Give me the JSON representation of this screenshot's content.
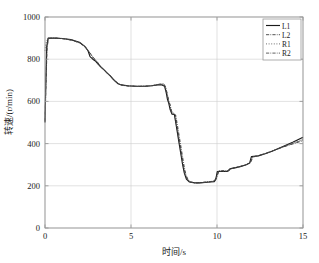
{
  "chart_data": {
    "type": "line",
    "title": "",
    "xlabel": "时间/s",
    "ylabel": "转速/(r/min)",
    "xlim": [
      0,
      15
    ],
    "ylim": [
      0,
      1000
    ],
    "xticks": [
      0,
      5,
      10,
      15
    ],
    "yticks": [
      0,
      200,
      400,
      600,
      800,
      1000
    ],
    "xtick_labels": [
      "0",
      "5",
      "10",
      "15"
    ],
    "ytick_labels": [
      "0",
      "200",
      "400",
      "600",
      "800",
      "1000"
    ],
    "grid": true,
    "legend_position": "top-right",
    "legend": [
      "L1",
      "L2",
      "R1",
      "R2"
    ],
    "series": [
      {
        "name": "L1",
        "style": "solid",
        "color": "#1a1a1a",
        "points": [
          [
            0.0,
            500
          ],
          [
            0.05,
            700
          ],
          [
            0.1,
            860
          ],
          [
            0.18,
            900
          ],
          [
            0.55,
            900
          ],
          [
            1.0,
            898
          ],
          [
            1.5,
            893
          ],
          [
            2.0,
            880
          ],
          [
            2.3,
            862
          ],
          [
            2.5,
            840
          ],
          [
            2.62,
            812
          ],
          [
            2.78,
            800
          ],
          [
            2.95,
            790
          ],
          [
            3.1,
            775
          ],
          [
            3.28,
            760
          ],
          [
            3.45,
            748
          ],
          [
            3.6,
            735
          ],
          [
            3.78,
            722
          ],
          [
            3.95,
            706
          ],
          [
            4.1,
            694
          ],
          [
            4.25,
            684
          ],
          [
            4.45,
            678
          ],
          [
            4.8,
            674
          ],
          [
            5.3,
            672
          ],
          [
            5.8,
            672
          ],
          [
            6.2,
            674
          ],
          [
            6.55,
            678
          ],
          [
            6.8,
            678
          ],
          [
            6.95,
            672
          ],
          [
            7.05,
            640
          ],
          [
            7.12,
            610
          ],
          [
            7.2,
            590
          ],
          [
            7.28,
            560
          ],
          [
            7.38,
            540
          ],
          [
            7.52,
            538
          ],
          [
            7.6,
            500
          ],
          [
            7.68,
            460
          ],
          [
            7.76,
            420
          ],
          [
            7.84,
            380
          ],
          [
            7.92,
            340
          ],
          [
            8.0,
            300
          ],
          [
            8.1,
            260
          ],
          [
            8.22,
            232
          ],
          [
            8.4,
            218
          ],
          [
            8.7,
            214
          ],
          [
            9.0,
            214
          ],
          [
            9.3,
            216
          ],
          [
            9.6,
            218
          ],
          [
            9.85,
            220
          ],
          [
            9.95,
            240
          ],
          [
            10.02,
            268
          ],
          [
            10.6,
            268
          ],
          [
            10.75,
            280
          ],
          [
            11.1,
            286
          ],
          [
            11.4,
            292
          ],
          [
            11.7,
            300
          ],
          [
            11.9,
            308
          ],
          [
            12.0,
            338
          ],
          [
            12.4,
            342
          ],
          [
            12.8,
            352
          ],
          [
            13.2,
            364
          ],
          [
            13.6,
            378
          ],
          [
            14.0,
            392
          ],
          [
            14.4,
            406
          ],
          [
            14.7,
            418
          ],
          [
            15.0,
            430
          ]
        ]
      },
      {
        "name": "L2",
        "style": "dashdot",
        "color": "#333333",
        "points": [
          [
            0.0,
            505
          ],
          [
            0.06,
            690
          ],
          [
            0.12,
            850
          ],
          [
            0.2,
            898
          ],
          [
            0.6,
            900
          ],
          [
            1.1,
            897
          ],
          [
            1.6,
            890
          ],
          [
            2.05,
            876
          ],
          [
            2.35,
            858
          ],
          [
            2.55,
            836
          ],
          [
            2.68,
            820
          ],
          [
            2.82,
            806
          ],
          [
            3.0,
            792
          ],
          [
            3.18,
            772
          ],
          [
            3.34,
            756
          ],
          [
            3.5,
            744
          ],
          [
            3.66,
            730
          ],
          [
            3.84,
            718
          ],
          [
            4.0,
            702
          ],
          [
            4.16,
            690
          ],
          [
            4.32,
            682
          ],
          [
            4.52,
            676
          ],
          [
            4.9,
            673
          ],
          [
            5.4,
            671
          ],
          [
            5.9,
            672
          ],
          [
            6.3,
            675
          ],
          [
            6.6,
            680
          ],
          [
            6.88,
            682
          ],
          [
            7.0,
            668
          ],
          [
            7.1,
            636
          ],
          [
            7.18,
            604
          ],
          [
            7.26,
            586
          ],
          [
            7.34,
            556
          ],
          [
            7.44,
            544
          ],
          [
            7.58,
            536
          ],
          [
            7.66,
            492
          ],
          [
            7.74,
            452
          ],
          [
            7.82,
            412
          ],
          [
            7.9,
            372
          ],
          [
            7.98,
            332
          ],
          [
            8.06,
            292
          ],
          [
            8.16,
            254
          ],
          [
            8.28,
            230
          ],
          [
            8.46,
            218
          ],
          [
            8.76,
            214
          ],
          [
            9.06,
            215
          ],
          [
            9.36,
            217
          ],
          [
            9.66,
            220
          ],
          [
            9.9,
            224
          ],
          [
            10.0,
            246
          ],
          [
            10.08,
            270
          ],
          [
            10.66,
            270
          ],
          [
            10.82,
            282
          ],
          [
            11.16,
            288
          ],
          [
            11.46,
            294
          ],
          [
            11.76,
            302
          ],
          [
            11.95,
            312
          ],
          [
            12.05,
            336
          ],
          [
            12.45,
            344
          ],
          [
            12.85,
            354
          ],
          [
            13.25,
            366
          ],
          [
            13.65,
            378
          ],
          [
            14.05,
            390
          ],
          [
            14.45,
            402
          ],
          [
            14.75,
            410
          ],
          [
            15.0,
            418
          ]
        ]
      },
      {
        "name": "R1",
        "style": "dotted",
        "color": "#555555",
        "points": [
          [
            0.0,
            840
          ],
          [
            0.04,
            870
          ],
          [
            0.1,
            888
          ],
          [
            0.2,
            900
          ],
          [
            0.58,
            900
          ],
          [
            1.05,
            898
          ],
          [
            1.55,
            892
          ],
          [
            2.02,
            878
          ],
          [
            2.32,
            860
          ],
          [
            2.52,
            842
          ],
          [
            2.66,
            826
          ],
          [
            2.8,
            804
          ],
          [
            2.98,
            788
          ],
          [
            3.14,
            770
          ],
          [
            3.3,
            758
          ],
          [
            3.48,
            746
          ],
          [
            3.62,
            732
          ],
          [
            3.8,
            720
          ],
          [
            3.98,
            704
          ],
          [
            4.14,
            692
          ],
          [
            4.3,
            682
          ],
          [
            4.5,
            677
          ],
          [
            4.86,
            674
          ],
          [
            5.36,
            672
          ],
          [
            5.86,
            673
          ],
          [
            6.26,
            676
          ],
          [
            6.58,
            680
          ],
          [
            6.84,
            680
          ],
          [
            6.98,
            670
          ],
          [
            7.08,
            638
          ],
          [
            7.15,
            608
          ],
          [
            7.23,
            588
          ],
          [
            7.31,
            558
          ],
          [
            7.41,
            542
          ],
          [
            7.55,
            538
          ],
          [
            7.63,
            496
          ],
          [
            7.71,
            456
          ],
          [
            7.79,
            416
          ],
          [
            7.87,
            376
          ],
          [
            7.95,
            336
          ],
          [
            8.03,
            296
          ],
          [
            8.13,
            258
          ],
          [
            8.25,
            231
          ],
          [
            8.43,
            218
          ],
          [
            8.73,
            214
          ],
          [
            9.03,
            214
          ],
          [
            9.33,
            216
          ],
          [
            9.63,
            219
          ],
          [
            9.88,
            222
          ],
          [
            9.98,
            244
          ],
          [
            10.05,
            269
          ],
          [
            10.63,
            269
          ],
          [
            10.78,
            281
          ],
          [
            11.13,
            287
          ],
          [
            11.43,
            293
          ],
          [
            11.73,
            301
          ],
          [
            11.92,
            310
          ],
          [
            12.02,
            337
          ],
          [
            12.42,
            343
          ],
          [
            12.82,
            353
          ],
          [
            13.22,
            365
          ],
          [
            13.62,
            378
          ],
          [
            14.02,
            391
          ],
          [
            14.42,
            404
          ],
          [
            14.72,
            414
          ],
          [
            15.0,
            424
          ]
        ]
      },
      {
        "name": "R2",
        "style": "dashdot",
        "color": "#444444",
        "points": [
          [
            0.0,
            510
          ],
          [
            0.05,
            700
          ],
          [
            0.11,
            855
          ],
          [
            0.19,
            899
          ],
          [
            0.62,
            900
          ],
          [
            1.15,
            896
          ],
          [
            1.65,
            888
          ],
          [
            2.08,
            874
          ],
          [
            2.38,
            854
          ],
          [
            2.58,
            832
          ],
          [
            2.72,
            818
          ],
          [
            2.86,
            802
          ],
          [
            3.04,
            786
          ],
          [
            3.22,
            768
          ],
          [
            3.38,
            754
          ],
          [
            3.54,
            742
          ],
          [
            3.7,
            728
          ],
          [
            3.88,
            714
          ],
          [
            4.04,
            700
          ],
          [
            4.2,
            688
          ],
          [
            4.36,
            680
          ],
          [
            4.56,
            675
          ],
          [
            4.94,
            672
          ],
          [
            5.44,
            671
          ],
          [
            5.94,
            672
          ],
          [
            6.34,
            676
          ],
          [
            6.64,
            682
          ],
          [
            6.92,
            684
          ],
          [
            7.02,
            666
          ],
          [
            7.12,
            632
          ],
          [
            7.2,
            602
          ],
          [
            7.28,
            582
          ],
          [
            7.36,
            552
          ],
          [
            7.46,
            546
          ],
          [
            7.6,
            534
          ],
          [
            7.7,
            488
          ],
          [
            7.78,
            448
          ],
          [
            7.86,
            408
          ],
          [
            7.94,
            368
          ],
          [
            8.02,
            328
          ],
          [
            8.1,
            288
          ],
          [
            8.2,
            252
          ],
          [
            8.32,
            229
          ],
          [
            8.5,
            217
          ],
          [
            8.8,
            214
          ],
          [
            9.1,
            215
          ],
          [
            9.4,
            218
          ],
          [
            9.7,
            221
          ],
          [
            9.92,
            226
          ],
          [
            10.04,
            250
          ],
          [
            10.12,
            272
          ],
          [
            10.7,
            272
          ],
          [
            10.86,
            283
          ],
          [
            11.2,
            289
          ],
          [
            11.5,
            295
          ],
          [
            11.8,
            303
          ],
          [
            11.98,
            314
          ],
          [
            12.08,
            335
          ],
          [
            12.48,
            345
          ],
          [
            12.88,
            355
          ],
          [
            13.28,
            367
          ],
          [
            13.68,
            379
          ],
          [
            14.08,
            390
          ],
          [
            14.48,
            400
          ],
          [
            14.78,
            408
          ],
          [
            15.0,
            414
          ]
        ]
      }
    ],
    "annotations": {
      "initial_vertical_dashed": {
        "x": 0,
        "y_from": 500,
        "y_to": 900,
        "note": "vertical rise at t=0"
      }
    }
  },
  "figure": {
    "background": "#ffffff",
    "axis_color": "#999999",
    "grid_color": "#cccccc",
    "text_color": "#222222"
  }
}
